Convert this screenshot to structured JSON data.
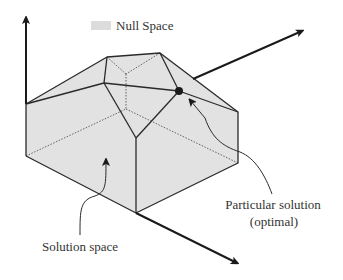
{
  "legend": {
    "swatch_color": "#dcdcdc",
    "label": "Null Space"
  },
  "labels": {
    "particular_solution_line1": "Particular solution",
    "particular_solution_line2": "(optimal)",
    "solution_space": "Solution space"
  },
  "colors": {
    "face_fill": "#e2e2e2",
    "edge": "#2a2a2a",
    "hidden_edge": "#555555",
    "axis": "#1a1a1a",
    "point": "#1a1a1a"
  },
  "axes": [
    {
      "name": "vertical-axis",
      "from": [
        26,
        104
      ],
      "to": [
        26,
        15
      ]
    },
    {
      "name": "right-axis",
      "from": [
        193,
        79
      ],
      "to": [
        305,
        30
      ]
    },
    {
      "name": "bottom-axis",
      "from": [
        136,
        213
      ],
      "to": [
        240,
        265
      ]
    }
  ],
  "particular_solution_point": [
    179,
    91
  ]
}
